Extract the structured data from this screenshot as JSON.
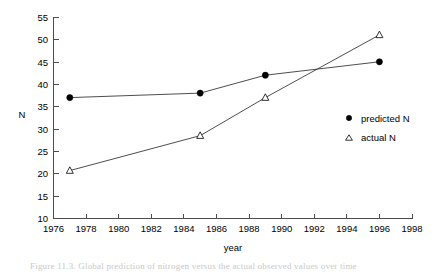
{
  "chart_data": {
    "type": "line",
    "title": "",
    "xlabel": "year",
    "ylabel": "N",
    "xlim": [
      1976,
      1998
    ],
    "ylim": [
      10,
      55
    ],
    "xticks": [
      1976,
      1978,
      1980,
      1982,
      1984,
      1986,
      1988,
      1990,
      1992,
      1994,
      1996,
      1998
    ],
    "yticks": [
      10,
      15,
      20,
      25,
      30,
      35,
      40,
      45,
      50,
      55
    ],
    "grid": false,
    "legend_position": "right-middle",
    "series": [
      {
        "name": "predicted N",
        "marker": "filled-circle",
        "x": [
          1977,
          1985,
          1989,
          1996
        ],
        "values": [
          37,
          38,
          42,
          45
        ]
      },
      {
        "name": "actual N",
        "marker": "open-triangle",
        "x": [
          1977,
          1985,
          1989,
          1996
        ],
        "values": [
          20.7,
          28.5,
          37,
          51
        ]
      }
    ]
  },
  "axes": {
    "y_tick_labels": [
      "55",
      "50",
      "45",
      "40",
      "35",
      "30",
      "25",
      "20",
      "15",
      "10"
    ],
    "x_tick_labels": [
      "1976",
      "1978",
      "1980",
      "1982",
      "1984",
      "1986",
      "1988",
      "1990",
      "1992",
      "1994",
      "1996",
      "1998"
    ],
    "y_axis_title": "N",
    "x_axis_title": "year"
  },
  "legend": {
    "entries": [
      {
        "label": "predicted N",
        "marker": "filled-circle-icon"
      },
      {
        "label": "actual N",
        "marker": "open-triangle-icon"
      }
    ]
  },
  "caption": {
    "text": "Figure 11.3. Global prediction of nitrogen versus the actual observed values over time"
  },
  "colors": {
    "axis": "#4d4d4d",
    "line": "#3a3a3a",
    "marker_fill": "#000000",
    "marker_open": "#ffffff",
    "background": "#ffffff",
    "text": "#000000"
  }
}
